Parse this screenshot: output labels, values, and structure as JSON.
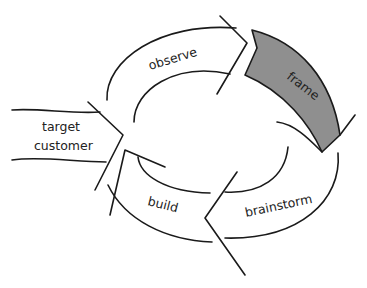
{
  "diagram": {
    "type": "cycle",
    "entry": {
      "label_line1": "target",
      "label_line2": "customer"
    },
    "stages": [
      {
        "label": "observe",
        "highlighted": false
      },
      {
        "label": "frame",
        "highlighted": true
      },
      {
        "label": "brainstorm",
        "highlighted": false
      },
      {
        "label": "build",
        "highlighted": false
      }
    ],
    "colors": {
      "highlight_fill": "#8f8f8f",
      "stroke": "#1a1a1a",
      "background": "#ffffff"
    }
  }
}
